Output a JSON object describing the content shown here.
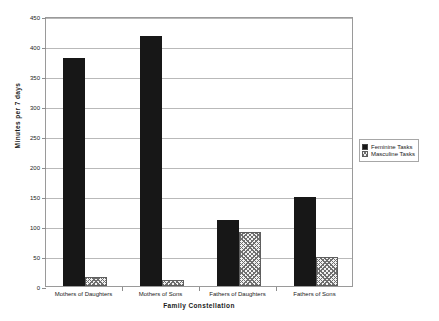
{
  "chart_data": {
    "type": "bar",
    "title": "",
    "xlabel": "Family Constellation",
    "ylabel": "Minutes per 7 days",
    "categories": [
      "Mothers of Daughters",
      "Mothers of Sons",
      "Fathers of Daughters",
      "Fathers of Sons"
    ],
    "series": [
      {
        "name": "Feminine Tasks",
        "values": [
          380,
          417,
          110,
          148
        ],
        "color": "#171717",
        "fill": "solid"
      },
      {
        "name": "Masculine Tasks",
        "values": [
          15,
          10,
          90,
          48
        ],
        "color": "#6f6f6f",
        "fill": "crosshatch"
      }
    ],
    "ylim": [
      0,
      450
    ],
    "ytick_step": 50,
    "yticks": [
      0,
      50,
      100,
      150,
      200,
      250,
      300,
      350,
      400,
      450
    ],
    "ytick_labels": [
      "0",
      "50",
      "100",
      "150",
      "200",
      "250",
      "300",
      "350",
      "400",
      "450"
    ],
    "grid": "horizontal",
    "legend_position": "right",
    "background": "#ffffff",
    "frame_color": "#9a9a9a",
    "grid_color": "#b9b9b9"
  }
}
